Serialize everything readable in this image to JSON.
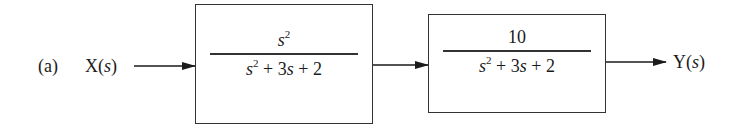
{
  "diagram": {
    "type": "block-diagram",
    "part_label": "(a)",
    "input": {
      "name": "X",
      "arg": "s"
    },
    "output": {
      "name": "Y",
      "arg": "s"
    },
    "blocks": [
      {
        "id": "G1",
        "numerator": {
          "var": "s",
          "exp": "2",
          "text": ""
        },
        "denominator": {
          "var": "s",
          "exp": "2",
          "rest": " + 3",
          "var2": "s",
          "tail": " + 2"
        }
      },
      {
        "id": "G2",
        "numerator": {
          "var": "",
          "exp": "",
          "text": "10"
        },
        "denominator": {
          "var": "s",
          "exp": "2",
          "rest": " + 3",
          "var2": "s",
          "tail": " + 2"
        }
      }
    ],
    "connections": [
      {
        "from": "X(s)",
        "to": "G1"
      },
      {
        "from": "G1",
        "to": "G2"
      },
      {
        "from": "G2",
        "to": "Y(s)"
      }
    ],
    "line_color": "#333333"
  }
}
